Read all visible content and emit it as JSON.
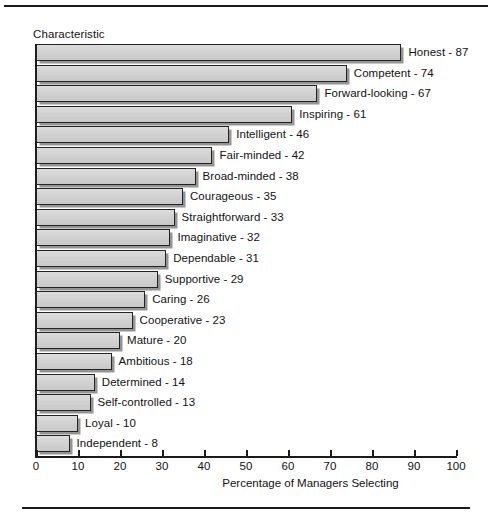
{
  "figure": {
    "y_axis_title": "Characteristic",
    "x_axis_title": "Percentage of Managers Selecting"
  },
  "chart_data": {
    "type": "bar",
    "orientation": "horizontal",
    "title": "",
    "xlabel": "Percentage of Managers Selecting",
    "ylabel": "Characteristic",
    "xlim": [
      0,
      100
    ],
    "xticks": [
      0,
      10,
      20,
      30,
      40,
      50,
      60,
      70,
      80,
      90,
      100
    ],
    "grid": false,
    "legend": false,
    "categories": [
      "Honest",
      "Competent",
      "Forward-looking",
      "Inspiring",
      "Intelligent",
      "Fair-minded",
      "Broad-minded",
      "Courageous",
      "Straightforward",
      "Imaginative",
      "Dependable",
      "Supportive",
      "Caring",
      "Cooperative",
      "Mature",
      "Ambitious",
      "Determined",
      "Self-controlled",
      "Loyal",
      "Independent"
    ],
    "values": [
      87,
      74,
      67,
      61,
      46,
      42,
      38,
      35,
      33,
      32,
      31,
      29,
      26,
      23,
      20,
      18,
      14,
      13,
      10,
      8
    ],
    "bars": [
      {
        "label": "Honest - 87",
        "category": "Honest",
        "value": 87
      },
      {
        "label": "Competent - 74",
        "category": "Competent",
        "value": 74
      },
      {
        "label": "Forward-looking - 67",
        "category": "Forward-looking",
        "value": 67
      },
      {
        "label": "Inspiring - 61",
        "category": "Inspiring",
        "value": 61
      },
      {
        "label": "Intelligent - 46",
        "category": "Intelligent",
        "value": 46
      },
      {
        "label": "Fair-minded - 42",
        "category": "Fair-minded",
        "value": 42
      },
      {
        "label": "Broad-minded - 38",
        "category": "Broad-minded",
        "value": 38
      },
      {
        "label": "Courageous - 35",
        "category": "Courageous",
        "value": 35
      },
      {
        "label": "Straightforward - 33",
        "category": "Straightforward",
        "value": 33
      },
      {
        "label": "Imaginative - 32",
        "category": "Imaginative",
        "value": 32
      },
      {
        "label": "Dependable - 31",
        "category": "Dependable",
        "value": 31
      },
      {
        "label": "Supportive - 29",
        "category": "Supportive",
        "value": 29
      },
      {
        "label": "Caring - 26",
        "category": "Caring",
        "value": 26
      },
      {
        "label": "Cooperative - 23",
        "category": "Cooperative",
        "value": 23
      },
      {
        "label": "Mature - 20",
        "category": "Mature",
        "value": 20
      },
      {
        "label": "Ambitious - 18",
        "category": "Ambitious",
        "value": 18
      },
      {
        "label": "Determined - 14",
        "category": "Determined",
        "value": 14
      },
      {
        "label": "Self-controlled - 13",
        "category": "Self-controlled",
        "value": 13
      },
      {
        "label": "Loyal - 10",
        "category": "Loyal",
        "value": 10
      },
      {
        "label": "Independent - 8",
        "category": "Independent",
        "value": 8
      }
    ]
  },
  "colors": {
    "bar_fill": "#d2d2d2",
    "bar_stroke": "#232323",
    "axis": "#1b1b1b",
    "text": "#121212",
    "background": "#ffffff"
  }
}
